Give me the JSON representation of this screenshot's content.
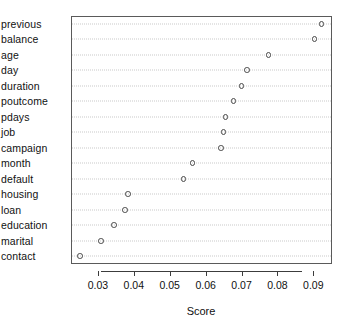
{
  "chart_data": {
    "type": "scatter",
    "plot_style": "dotchart",
    "title": "",
    "xlabel": "Score",
    "ylabel": "",
    "categories": [
      "previous",
      "balance",
      "age",
      "day",
      "duration",
      "poutcome",
      "pdays",
      "job",
      "campaign",
      "month",
      "default",
      "housing",
      "loan",
      "education",
      "marital",
      "contact"
    ],
    "values": [
      0.0923,
      0.0903,
      0.0775,
      0.0716,
      0.07,
      0.0678,
      0.0655,
      0.065,
      0.0643,
      0.0563,
      0.0538,
      0.0383,
      0.0375,
      0.0345,
      0.0308,
      0.025
    ],
    "xlim": [
      0.0225,
      0.0952
    ],
    "xticks": [
      0.03,
      0.04,
      0.05,
      0.06,
      0.07,
      0.08,
      0.09
    ],
    "xticklabels": [
      "0.03",
      "0.04",
      "0.05",
      "0.06",
      "0.07",
      "0.08",
      "0.09"
    ],
    "grid": true,
    "grid_orientation": "horizontal",
    "grid_style": "dotted",
    "legend": null,
    "marker": "open-circle",
    "colors": {
      "marker_stroke": "#4a4a4a",
      "gridline": "#c9c9c9",
      "axis": "#3c3c3c",
      "frame": "#5a5a5a",
      "text": "#111111",
      "background": "#ffffff"
    }
  }
}
